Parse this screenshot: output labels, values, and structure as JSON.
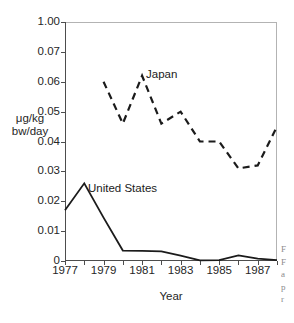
{
  "chart_data": {
    "type": "line",
    "title": "",
    "subtitle": "",
    "xlabel": "Year",
    "ylabel": "μg/kg bw/day",
    "ylabel_lines": [
      "μg/kg",
      "bw/day"
    ],
    "grid": false,
    "legend_position": "inline-annotation",
    "x": [
      1977,
      1978,
      1979,
      1980,
      1981,
      1982,
      1983,
      1984,
      1985,
      1986,
      1987,
      1988
    ],
    "xlim": [
      1977,
      1988
    ],
    "xticklabels": [
      "1977",
      "1979",
      "1981",
      "1983",
      "1985",
      "1987"
    ],
    "xtickvalues": [
      1977,
      1979,
      1981,
      1983,
      1985,
      1987
    ],
    "yticklabels": [
      "1.00",
      "0.07",
      "0.06",
      "0.05",
      "0.04",
      "0.03",
      "0.02",
      "0.01",
      "0"
    ],
    "ytickvalues": [
      0.08,
      0.07,
      0.06,
      0.05,
      0.04,
      0.03,
      0.02,
      0.01,
      0
    ],
    "ylim": [
      0,
      0.08
    ],
    "series": [
      {
        "name": "Japan",
        "style": "dashed",
        "color": "#1b1b1b",
        "x": [
          1979,
          1980,
          1981,
          1982,
          1983,
          1984,
          1985,
          1986,
          1987,
          1988
        ],
        "values": [
          0.06,
          0.046,
          0.062,
          0.046,
          0.05,
          0.04,
          0.04,
          0.031,
          0.032,
          0.045
        ]
      },
      {
        "name": "United States",
        "style": "solid",
        "color": "#1b1b1b",
        "x": [
          1977,
          1978,
          1979,
          1980,
          1981,
          1982,
          1983,
          1984,
          1985,
          1986,
          1987,
          1988
        ],
        "values": [
          0.017,
          0.026,
          0.0145,
          0.0035,
          0.0034,
          0.0032,
          0.0018,
          0.0002,
          0.0003,
          0.0019,
          0.0008,
          0.0003
        ]
      }
    ],
    "annotations": [
      {
        "text": "Japan",
        "x": 1982,
        "y": 0.06
      },
      {
        "text": "United States",
        "x": 1979,
        "y": 0.0245
      }
    ]
  },
  "axes": {
    "y_title_line1": "μg/kg",
    "y_title_line2": "bw/day",
    "x_title": "Year"
  },
  "annotations": {
    "japan": "Japan",
    "united_states": "United States"
  },
  "caption_fragment": {
    "lines": [
      "F",
      "F",
      "a",
      "p",
      "r"
    ]
  }
}
